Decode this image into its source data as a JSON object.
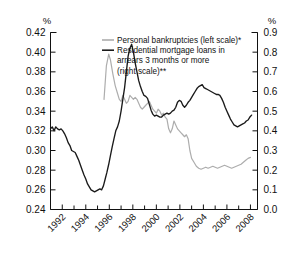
{
  "chart_data": {
    "type": "line",
    "title": "",
    "subtitle": "",
    "xlabel": "",
    "ylabel": "%",
    "ylabel_right": "%",
    "grid": false,
    "legend_position": "top-center",
    "x_axis": {
      "tick_labels": [
        "1992",
        "1994",
        "1996",
        "1998",
        "2000",
        "2002",
        "2004",
        "2006",
        "2008"
      ],
      "tick_values": [
        1992,
        1994,
        1996,
        1998,
        2000,
        2002,
        2004,
        2006,
        2008
      ],
      "minor_tick_values": [
        1993,
        1995,
        1997,
        1999,
        2001,
        2003,
        2005,
        2007
      ],
      "range": [
        1991.0,
        2008.6
      ],
      "label_rotation": -45
    },
    "y_axis_left": {
      "label": "%",
      "tick_labels": [
        "0.24",
        "0.26",
        "0.28",
        "0.30",
        "0.32",
        "0.34",
        "0.36",
        "0.38",
        "0.40",
        "0.42"
      ],
      "tick_values": [
        0.24,
        0.26,
        0.28,
        0.3,
        0.32,
        0.34,
        0.36,
        0.38,
        0.4,
        0.42
      ],
      "range": [
        0.24,
        0.42
      ]
    },
    "y_axis_right": {
      "label": "%",
      "tick_labels": [
        "0.0",
        "0.1",
        "0.2",
        "0.3",
        "0.4",
        "0.5",
        "0.6",
        "0.7",
        "0.8",
        "0.9"
      ],
      "tick_values": [
        0.0,
        0.1,
        0.2,
        0.3,
        0.4,
        0.5,
        0.6,
        0.7,
        0.8,
        0.9
      ],
      "range": [
        0.0,
        0.9
      ]
    },
    "legend": [
      {
        "label": "Personal bankruptcies (left scale)*",
        "color": "#adadad",
        "axis": "left"
      },
      {
        "label": "Residential mortgage loans in",
        "color": "#1a1a1a",
        "axis": "right"
      },
      {
        "label": "arrears 3 months or more",
        "color": null,
        "axis": null
      },
      {
        "label": "(right scale)**",
        "color": null,
        "axis": null
      }
    ],
    "series": [
      {
        "name": "Personal bankruptcies (left scale)*",
        "color": "#adadad",
        "axis": "left",
        "units": "%",
        "x": [
          1995.55,
          1995.75,
          1995.95,
          1996.1,
          1996.3,
          1996.5,
          1996.7,
          1996.85,
          1997.0,
          1997.15,
          1997.3,
          1997.45,
          1997.6,
          1997.75,
          1997.9,
          1998.05,
          1998.2,
          1998.35,
          1998.5,
          1998.65,
          1998.8,
          1998.95,
          1999.1,
          1999.25,
          1999.4,
          1999.55,
          1999.7,
          1999.85,
          2000.0,
          2000.15,
          2000.3,
          2000.45,
          2000.6,
          2000.75,
          2000.9,
          2001.05,
          2001.2,
          2001.35,
          2001.5,
          2001.65,
          2001.8,
          2001.95,
          2002.1,
          2002.25,
          2002.4,
          2002.55,
          2002.7,
          2002.85,
          2003.0,
          2003.2,
          2003.4,
          2003.6,
          2003.8,
          2004.0,
          2004.2,
          2004.4,
          2004.6,
          2004.8,
          2005.0,
          2005.2,
          2005.4,
          2005.6,
          2005.8,
          2006.0,
          2006.2,
          2006.4,
          2006.6,
          2006.8,
          2007.0,
          2007.2,
          2007.4,
          2007.6,
          2007.8,
          2008.0
        ],
        "values": [
          0.352,
          0.386,
          0.398,
          0.392,
          0.378,
          0.366,
          0.358,
          0.352,
          0.35,
          0.356,
          0.352,
          0.348,
          0.35,
          0.356,
          0.354,
          0.352,
          0.354,
          0.352,
          0.348,
          0.344,
          0.342,
          0.344,
          0.346,
          0.348,
          0.35,
          0.346,
          0.342,
          0.34,
          0.338,
          0.342,
          0.34,
          0.336,
          0.338,
          0.334,
          0.332,
          0.322,
          0.318,
          0.322,
          0.33,
          0.326,
          0.322,
          0.32,
          0.318,
          0.316,
          0.314,
          0.316,
          0.312,
          0.3,
          0.292,
          0.288,
          0.284,
          0.282,
          0.281,
          0.282,
          0.283,
          0.282,
          0.283,
          0.284,
          0.283,
          0.282,
          0.283,
          0.284,
          0.285,
          0.284,
          0.283,
          0.282,
          0.283,
          0.284,
          0.285,
          0.286,
          0.288,
          0.29,
          0.292,
          0.293
        ]
      },
      {
        "name": "Residential mortgage loans in arrears 3 months or more (right scale)**",
        "color": "#1a1a1a",
        "axis": "right",
        "units": "%",
        "x": [
          1991.0,
          1991.15,
          1991.3,
          1991.45,
          1991.6,
          1991.75,
          1991.9,
          1992.05,
          1992.2,
          1992.35,
          1992.5,
          1992.65,
          1992.8,
          1992.95,
          1993.1,
          1993.25,
          1993.4,
          1993.55,
          1993.7,
          1993.85,
          1994.0,
          1994.15,
          1994.3,
          1994.45,
          1994.6,
          1994.75,
          1994.9,
          1995.05,
          1995.2,
          1995.35,
          1995.5,
          1995.65,
          1995.8,
          1995.95,
          1996.1,
          1996.25,
          1996.4,
          1996.55,
          1996.7,
          1996.85,
          1997.0,
          1997.15,
          1997.3,
          1997.45,
          1997.6,
          1997.75,
          1997.9,
          1998.05,
          1998.2,
          1998.35,
          1998.5,
          1998.65,
          1998.8,
          1998.95,
          1999.1,
          1999.25,
          1999.4,
          1999.55,
          1999.7,
          1999.85,
          2000.0,
          2000.15,
          2000.3,
          2000.45,
          2000.6,
          2000.75,
          2000.9,
          2001.05,
          2001.2,
          2001.35,
          2001.5,
          2001.65,
          2001.8,
          2001.95,
          2002.1,
          2002.25,
          2002.4,
          2002.55,
          2002.7,
          2002.85,
          2003.0,
          2003.15,
          2003.3,
          2003.45,
          2003.6,
          2003.75,
          2003.9,
          2004.05,
          2004.2,
          2004.35,
          2004.5,
          2004.65,
          2004.8,
          2004.95,
          2005.1,
          2005.25,
          2005.4,
          2005.55,
          2005.7,
          2005.85,
          2006.0,
          2006.15,
          2006.3,
          2006.45,
          2006.6,
          2006.75,
          2006.9,
          2007.05,
          2007.2,
          2007.35,
          2007.5,
          2007.65,
          2007.8,
          2007.95,
          2008.1
        ],
        "values": [
          0.41,
          0.42,
          0.4,
          0.42,
          0.41,
          0.405,
          0.41,
          0.4,
          0.385,
          0.365,
          0.34,
          0.325,
          0.3,
          0.295,
          0.29,
          0.27,
          0.25,
          0.225,
          0.2,
          0.175,
          0.155,
          0.13,
          0.115,
          0.1,
          0.095,
          0.09,
          0.095,
          0.1,
          0.105,
          0.1,
          0.12,
          0.155,
          0.19,
          0.23,
          0.275,
          0.32,
          0.36,
          0.4,
          0.42,
          0.45,
          0.5,
          0.56,
          0.62,
          0.7,
          0.78,
          0.82,
          0.84,
          0.8,
          0.745,
          0.7,
          0.655,
          0.625,
          0.6,
          0.58,
          0.575,
          0.565,
          0.535,
          0.505,
          0.485,
          0.475,
          0.48,
          0.475,
          0.47,
          0.47,
          0.48,
          0.485,
          0.49,
          0.485,
          0.49,
          0.5,
          0.505,
          0.52,
          0.545,
          0.555,
          0.55,
          0.53,
          0.52,
          0.53,
          0.545,
          0.555,
          0.57,
          0.585,
          0.6,
          0.615,
          0.625,
          0.63,
          0.635,
          0.62,
          0.615,
          0.61,
          0.605,
          0.6,
          0.595,
          0.59,
          0.585,
          0.585,
          0.58,
          0.565,
          0.545,
          0.52,
          0.5,
          0.48,
          0.46,
          0.445,
          0.43,
          0.425,
          0.42,
          0.425,
          0.43,
          0.435,
          0.44,
          0.45,
          0.455,
          0.47,
          0.48
        ]
      }
    ]
  }
}
